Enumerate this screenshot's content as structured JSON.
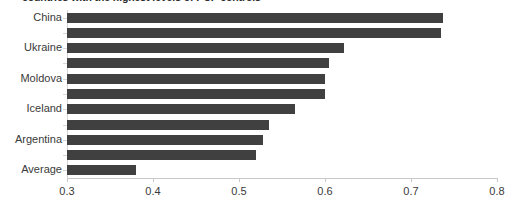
{
  "chart_data": {
    "type": "bar",
    "orientation": "horizontal",
    "title": "countries with the highest levels of PCP controls",
    "xlabel": "",
    "ylabel": "",
    "xlim": [
      0.3,
      0.8
    ],
    "xticks": [
      "0.3",
      "0.4",
      "0.5",
      "0.6",
      "0.7",
      "0.8"
    ],
    "xtick_values": [
      0.3,
      0.4,
      0.5,
      0.6,
      0.7,
      0.8
    ],
    "grid": false,
    "legend": false,
    "bar_color": "#404040",
    "axis_color": "#c9c9c9",
    "categories": [
      "China",
      "",
      "Ukraine",
      "",
      "Moldova",
      "",
      "Iceland",
      "",
      "Argentina",
      "",
      "Average"
    ],
    "visible_tick_labels": [
      "China",
      "Ukraine",
      "Moldova",
      "Iceland",
      "Argentina",
      "Average"
    ],
    "values": [
      0.737,
      0.735,
      0.622,
      0.605,
      0.6,
      0.6,
      0.565,
      0.535,
      0.528,
      0.52,
      0.38
    ]
  }
}
